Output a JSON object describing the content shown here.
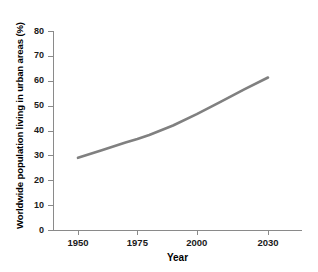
{
  "chart_data": {
    "type": "line",
    "title": "",
    "xlabel": "Year",
    "ylabel": "Worldwide population living in urban areas (%)",
    "xlim": [
      1938,
      2043
    ],
    "ylim": [
      0,
      80
    ],
    "grid": false,
    "legend": "none",
    "line_color": "#808080",
    "axis_color": "#8a8a8a",
    "text_color": "#1a1a1a",
    "xticks": [
      1950,
      1975,
      2000,
      2030
    ],
    "xtick_labels": [
      "1950",
      "1975",
      "2000",
      "2030"
    ],
    "yticks": [
      0,
      10,
      20,
      30,
      40,
      50,
      60,
      70,
      80
    ],
    "ytick_labels": [
      "0",
      "10",
      "20",
      "30",
      "40",
      "50",
      "60",
      "70",
      "80"
    ],
    "series": [
      {
        "name": "Worldwide urban population",
        "x": [
          1950,
          1960,
          1970,
          1975,
          1980,
          1990,
          2000,
          2010,
          2020,
          2030
        ],
        "values": [
          29.0,
          32.1,
          35.2,
          36.6,
          38.2,
          42.0,
          46.6,
          51.5,
          56.5,
          61.3
        ]
      }
    ]
  }
}
